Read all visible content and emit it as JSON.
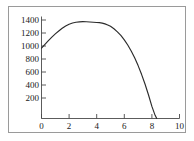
{
  "chart_data": {
    "type": "line",
    "title": "",
    "xlabel": "",
    "ylabel": "",
    "xlim": [
      0,
      10
    ],
    "ylim": [
      0,
      1500
    ],
    "grid": false,
    "legend": null,
    "xticks": [
      0,
      2,
      4,
      6,
      8,
      10
    ],
    "xtick_labels": [
      "0",
      "2",
      "4",
      "6",
      "8",
      "10"
    ],
    "yticks": [
      200,
      400,
      600,
      800,
      1000,
      1200,
      1400
    ],
    "ytick_labels": [
      "200",
      "400",
      "600",
      "800",
      "1000",
      "1200",
      "1400"
    ],
    "axis_color": "#4a4a4a",
    "curve_color": "#2b2b2b",
    "frame_color": "#9a9a9a",
    "background_color": "#ffffff",
    "series": [
      {
        "name": "curve",
        "x": [
          0.0,
          0.25,
          0.5,
          0.75,
          1.0,
          1.25,
          1.5,
          1.75,
          2.0,
          2.25,
          2.5,
          2.75,
          3.0,
          3.25,
          3.5,
          3.75,
          4.0,
          4.2,
          4.4,
          4.6,
          4.8,
          5.0,
          5.25,
          5.5,
          5.75,
          6.0,
          6.25,
          6.5,
          6.75,
          7.0,
          7.25,
          7.5,
          7.75,
          8.0,
          8.2,
          8.35
        ],
        "y": [
          1000,
          1055,
          1107,
          1156,
          1202,
          1244,
          1282,
          1315,
          1340,
          1357,
          1368,
          1374,
          1376,
          1375,
          1371,
          1368,
          1365,
          1362,
          1356,
          1345,
          1330,
          1310,
          1275,
          1232,
          1180,
          1118,
          1045,
          960,
          862,
          752,
          628,
          490,
          338,
          172,
          62,
          0
        ]
      }
    ],
    "annotations": {
      "start_point": "(0, 1000)",
      "peak_point": "(4.2, 1375)",
      "x_intercept": "(8.35, 0)"
    }
  }
}
